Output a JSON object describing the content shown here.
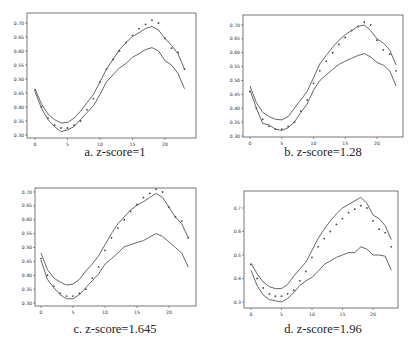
{
  "figure": {
    "panels": [
      {
        "id": "a",
        "caption": "a. z-score=1"
      },
      {
        "id": "b",
        "caption": "b. z-score=1.28"
      },
      {
        "id": "c",
        "caption": "c. z-score=1.645"
      },
      {
        "id": "d",
        "caption": "d. z-score=1.96"
      }
    ]
  },
  "chart_data": [
    {
      "type": "line",
      "title": "a. z-score=1",
      "xlabel": "",
      "ylabel": "",
      "xlim": [
        -1,
        24
      ],
      "ylim": [
        0.295,
        0.725
      ],
      "xticks": [
        0,
        5,
        10,
        15,
        20
      ],
      "yticks": [
        0.3,
        0.35,
        0.4,
        0.45,
        0.5,
        0.55,
        0.6,
        0.65,
        0.7
      ],
      "ytick_labels": [
        "0.30",
        "0.35",
        "0.40",
        "0.45",
        "0.50",
        "0.55",
        "0.60",
        "0.65",
        "0.70"
      ],
      "grid": false,
      "x": [
        0,
        1,
        2,
        3,
        4,
        5,
        6,
        7,
        8,
        9,
        10,
        11,
        12,
        13,
        14,
        15,
        16,
        17,
        18,
        19,
        20,
        21,
        22,
        23
      ],
      "series": [
        {
          "name": "observed",
          "style": "dots",
          "values": [
            0.46,
            0.4,
            0.36,
            0.335,
            0.325,
            0.325,
            0.335,
            0.35,
            0.39,
            0.43,
            0.49,
            0.535,
            0.57,
            0.6,
            0.63,
            0.655,
            0.68,
            0.695,
            0.71,
            0.7,
            0.645,
            0.61,
            0.595,
            0.535
          ]
        },
        {
          "name": "upper bound",
          "style": "line",
          "values": [
            0.465,
            0.41,
            0.375,
            0.355,
            0.343,
            0.345,
            0.36,
            0.385,
            0.415,
            0.445,
            0.49,
            0.535,
            0.57,
            0.605,
            0.63,
            0.652,
            0.665,
            0.68,
            0.688,
            0.675,
            0.645,
            0.62,
            0.59,
            0.535
          ]
        },
        {
          "name": "lower bound",
          "style": "line",
          "values": [
            0.455,
            0.395,
            0.355,
            0.33,
            0.312,
            0.318,
            0.33,
            0.355,
            0.38,
            0.405,
            0.445,
            0.49,
            0.515,
            0.54,
            0.555,
            0.578,
            0.59,
            0.605,
            0.612,
            0.6,
            0.565,
            0.55,
            0.52,
            0.465
          ]
        }
      ]
    },
    {
      "type": "line",
      "title": "b. z-score=1.28",
      "xlabel": "",
      "ylabel": "",
      "xlim": [
        -1,
        24
      ],
      "ylim": [
        0.3,
        0.725
      ],
      "xticks": [
        0,
        5,
        10,
        15,
        20
      ],
      "yticks": [
        0.3,
        0.35,
        0.4,
        0.45,
        0.5,
        0.55,
        0.6,
        0.65,
        0.7
      ],
      "ytick_labels": [
        "0.30",
        "0.35",
        "0.40",
        "0.45",
        "0.50",
        "0.55",
        "0.60",
        "0.65",
        "0.70"
      ],
      "grid": false,
      "x": [
        0,
        1,
        2,
        3,
        4,
        5,
        6,
        7,
        8,
        9,
        10,
        11,
        12,
        13,
        14,
        15,
        16,
        17,
        18,
        19,
        20,
        21,
        22,
        23
      ],
      "series": [
        {
          "name": "observed",
          "style": "dots",
          "values": [
            0.46,
            0.4,
            0.36,
            0.335,
            0.325,
            0.325,
            0.335,
            0.35,
            0.39,
            0.43,
            0.49,
            0.535,
            0.57,
            0.6,
            0.63,
            0.655,
            0.68,
            0.695,
            0.71,
            0.7,
            0.645,
            0.61,
            0.595,
            0.535
          ]
        },
        {
          "name": "upper bound",
          "style": "line",
          "values": [
            0.48,
            0.42,
            0.385,
            0.37,
            0.36,
            0.358,
            0.37,
            0.4,
            0.43,
            0.46,
            0.51,
            0.56,
            0.59,
            0.62,
            0.645,
            0.665,
            0.68,
            0.695,
            0.7,
            0.68,
            0.65,
            0.635,
            0.61,
            0.555
          ]
        },
        {
          "name": "lower bound",
          "style": "line",
          "values": [
            0.465,
            0.4,
            0.345,
            0.34,
            0.325,
            0.32,
            0.33,
            0.35,
            0.385,
            0.415,
            0.465,
            0.5,
            0.52,
            0.54,
            0.558,
            0.57,
            0.58,
            0.59,
            0.597,
            0.585,
            0.565,
            0.555,
            0.535,
            0.48
          ]
        }
      ]
    },
    {
      "type": "line",
      "title": "c. z-score=1.645",
      "xlabel": "",
      "ylabel": "",
      "xlim": [
        -1,
        24
      ],
      "ylim": [
        0.295,
        0.72
      ],
      "xticks": [
        0,
        5,
        10,
        15,
        20
      ],
      "yticks": [
        0.3,
        0.35,
        0.4,
        0.45,
        0.5,
        0.55,
        0.6,
        0.65,
        0.7
      ],
      "ytick_labels": [
        "0.30",
        "0.35",
        "0.40",
        "0.45",
        "0.50",
        "0.55",
        "0.60",
        "0.65",
        "0.70"
      ],
      "grid": false,
      "x": [
        0,
        1,
        2,
        3,
        4,
        5,
        6,
        7,
        8,
        9,
        10,
        11,
        12,
        13,
        14,
        15,
        16,
        17,
        18,
        19,
        20,
        21,
        22,
        23
      ],
      "series": [
        {
          "name": "observed",
          "style": "dots",
          "values": [
            0.46,
            0.4,
            0.36,
            0.335,
            0.325,
            0.325,
            0.335,
            0.35,
            0.39,
            0.43,
            0.49,
            0.535,
            0.57,
            0.6,
            0.63,
            0.655,
            0.68,
            0.695,
            0.71,
            0.7,
            0.645,
            0.61,
            0.595,
            0.535
          ]
        },
        {
          "name": "upper bound",
          "style": "line",
          "values": [
            0.48,
            0.42,
            0.39,
            0.375,
            0.365,
            0.368,
            0.385,
            0.415,
            0.44,
            0.47,
            0.51,
            0.55,
            0.585,
            0.61,
            0.635,
            0.652,
            0.665,
            0.68,
            0.695,
            0.68,
            0.645,
            0.61,
            0.585,
            0.535
          ]
        },
        {
          "name": "lower bound",
          "style": "line",
          "values": [
            0.455,
            0.385,
            0.355,
            0.33,
            0.315,
            0.315,
            0.33,
            0.355,
            0.38,
            0.405,
            0.44,
            0.46,
            0.48,
            0.502,
            0.51,
            0.518,
            0.525,
            0.538,
            0.55,
            0.54,
            0.52,
            0.5,
            0.48,
            0.43
          ]
        }
      ]
    },
    {
      "type": "line",
      "title": "d. z-score=1.96",
      "xlabel": "",
      "ylabel": "",
      "xlim": [
        -1,
        24
      ],
      "ylim": [
        0.28,
        0.76
      ],
      "xticks": [
        0,
        5,
        10,
        15,
        20
      ],
      "yticks": [
        0.3,
        0.4,
        0.5,
        0.6,
        0.7
      ],
      "ytick_labels": [
        "0.3",
        "0.4",
        "0.5",
        "0.6",
        "0.7"
      ],
      "grid": false,
      "x": [
        0,
        1,
        2,
        3,
        4,
        5,
        6,
        7,
        8,
        9,
        10,
        11,
        12,
        13,
        14,
        15,
        16,
        17,
        18,
        19,
        20,
        21,
        22,
        23
      ],
      "series": [
        {
          "name": "observed",
          "style": "dots",
          "values": [
            0.46,
            0.4,
            0.36,
            0.335,
            0.325,
            0.325,
            0.335,
            0.35,
            0.39,
            0.43,
            0.49,
            0.535,
            0.57,
            0.6,
            0.63,
            0.655,
            0.68,
            0.695,
            0.71,
            0.7,
            0.645,
            0.61,
            0.595,
            0.535
          ]
        },
        {
          "name": "upper bound",
          "style": "line",
          "values": [
            0.465,
            0.42,
            0.385,
            0.365,
            0.357,
            0.357,
            0.375,
            0.41,
            0.44,
            0.47,
            0.52,
            0.57,
            0.61,
            0.645,
            0.675,
            0.7,
            0.715,
            0.73,
            0.745,
            0.72,
            0.67,
            0.655,
            0.625,
            0.565
          ]
        },
        {
          "name": "lower bound",
          "style": "line",
          "values": [
            0.435,
            0.37,
            0.33,
            0.31,
            0.305,
            0.3,
            0.315,
            0.34,
            0.37,
            0.39,
            0.405,
            0.43,
            0.46,
            0.475,
            0.49,
            0.5,
            0.51,
            0.51,
            0.535,
            0.525,
            0.5,
            0.5,
            0.495,
            0.435
          ]
        }
      ]
    }
  ]
}
